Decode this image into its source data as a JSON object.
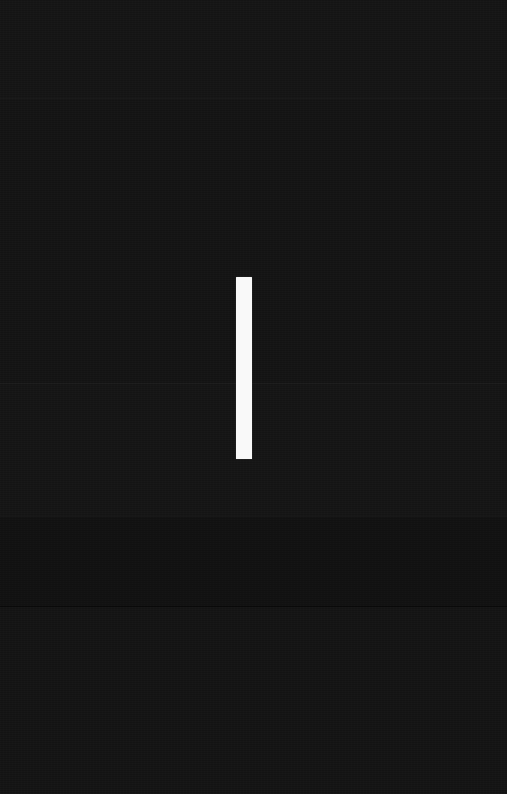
{
  "screen": {
    "width": 507,
    "height": 794,
    "background_color": "#131313",
    "description": "Near-black screen with a single vertical white bar",
    "content_text": ""
  },
  "caret": {
    "name": "text-cursor",
    "color": "#f9f9f9",
    "x": 236,
    "y": 277,
    "width": 16,
    "height": 182,
    "label": ""
  },
  "bands": [
    {
      "top": 0,
      "height": 98,
      "shade": "rgba(255,255,255,0.008)"
    },
    {
      "top": 98,
      "height": 285,
      "shade": "rgba(255,255,255,0.000)"
    },
    {
      "top": 383,
      "height": 133,
      "shade": "rgba(255,255,255,0.006)"
    },
    {
      "top": 516,
      "height": 90,
      "shade": "rgba(0,0,0,0.10)"
    },
    {
      "top": 606,
      "height": 188,
      "shade": "rgba(255,255,255,0.004)"
    }
  ],
  "seams": [
    {
      "top": 98,
      "type": "light"
    },
    {
      "top": 383,
      "type": "light"
    },
    {
      "top": 516,
      "type": "light"
    },
    {
      "top": 606,
      "type": "dark"
    }
  ]
}
